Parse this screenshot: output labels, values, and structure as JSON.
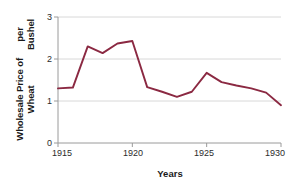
{
  "chart_data": {
    "type": "line",
    "title": "",
    "xlabel": "Years",
    "ylabel": "Wholesale Price of Wheat per Bushel",
    "ylabel_lines": [
      "Wholesale Price of Wheat",
      "per Bushel"
    ],
    "x": [
      1915,
      1916,
      1917,
      1918,
      1919,
      1920,
      1921,
      1922,
      1923,
      1924,
      1925,
      1926,
      1927,
      1928,
      1929,
      1930
    ],
    "values": [
      1.3,
      1.32,
      2.3,
      2.14,
      2.37,
      2.43,
      1.33,
      1.22,
      1.1,
      1.22,
      1.67,
      1.45,
      1.37,
      1.3,
      1.2,
      0.9
    ],
    "series": [
      {
        "name": "Wholesale Price of Wheat per Bushel",
        "values": [
          1.3,
          1.32,
          2.3,
          2.14,
          2.37,
          2.43,
          1.33,
          1.22,
          1.1,
          1.22,
          1.67,
          1.45,
          1.37,
          1.3,
          1.2,
          0.9
        ]
      }
    ],
    "xlim": [
      1915,
      1930
    ],
    "ylim": [
      0,
      3
    ],
    "xticks": [
      1915,
      1920,
      1925,
      1930
    ],
    "xtick_labels": [
      "1915",
      "1920",
      "1925",
      "1930"
    ],
    "yticks": [
      0,
      1,
      2,
      3
    ],
    "ytick_labels": [
      "0",
      "1",
      "2",
      "3"
    ],
    "grid": true,
    "grid_axis": "y",
    "legend": false,
    "legend_position": "none",
    "line_color": "#8B2942",
    "grid_color": "#d8d8d8",
    "axis_color": "#9a9a9a",
    "background_color": "#ffffff"
  }
}
